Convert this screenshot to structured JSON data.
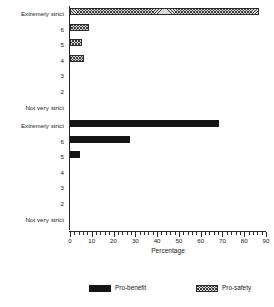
{
  "chart_data": {
    "type": "bar",
    "orientation": "horizontal",
    "title": "",
    "xlabel": "Percentage",
    "ylabel": "",
    "xlim": [
      0,
      90
    ],
    "xticks": [
      0,
      10,
      20,
      30,
      40,
      50,
      60,
      70,
      80,
      90
    ],
    "xtick_labels": [
      "0",
      "10",
      "20",
      "30",
      "40",
      "50",
      "60",
      "70",
      "80",
      "90"
    ],
    "minor_tick_step": 2,
    "grid": false,
    "legend_position": "bottom",
    "categories": [
      "Extremely strict",
      "6",
      "5",
      "4",
      "3",
      "2",
      "Not very strict"
    ],
    "panels": [
      {
        "name": "pro-safety",
        "series_name": "Pro-safety",
        "fill": "cross-hatch",
        "color": "#d9d9d9",
        "values": [
          86.7,
          8.7,
          5.5,
          6.4,
          0,
          0,
          0
        ]
      },
      {
        "name": "pro-benefit",
        "series_name": "Pro-benefit",
        "fill": "solid",
        "color": "#151515",
        "values": [
          68.3,
          27.5,
          4.6,
          0,
          0,
          0,
          0
        ]
      }
    ]
  },
  "axis": {
    "xlabel": "Percentage",
    "ticks": [
      {
        "value": 0,
        "label": "0"
      },
      {
        "value": 10,
        "label": "10"
      },
      {
        "value": 20,
        "label": "20"
      },
      {
        "value": 30,
        "label": "30"
      },
      {
        "value": 40,
        "label": "40"
      },
      {
        "value": 50,
        "label": "50"
      },
      {
        "value": 60,
        "label": "60"
      },
      {
        "value": 70,
        "label": "70"
      },
      {
        "value": 80,
        "label": "80"
      },
      {
        "value": 90,
        "label": "90"
      }
    ]
  },
  "legend": {
    "entries": [
      {
        "label": "Pro-benefit",
        "swatch": "solid-black-swatch"
      },
      {
        "label": "Pro-safety",
        "swatch": "hatched-gray-swatch"
      }
    ]
  },
  "panel_top": {
    "name": "pro-safety-panel",
    "categories": [
      {
        "label": "Extremely strict",
        "value": 86.7
      },
      {
        "label": "6",
        "value": 8.7
      },
      {
        "label": "5",
        "value": 5.5
      },
      {
        "label": "4",
        "value": 6.4
      },
      {
        "label": "3",
        "value": 0
      },
      {
        "label": "2",
        "value": 0
      },
      {
        "label": "Not very strict",
        "value": 0
      }
    ]
  },
  "panel_bottom": {
    "name": "pro-benefit-panel",
    "categories": [
      {
        "label": "Extremely strict",
        "value": 68.3
      },
      {
        "label": "6",
        "value": 27.5
      },
      {
        "label": "5",
        "value": 4.6
      },
      {
        "label": "4",
        "value": 0
      },
      {
        "label": "3",
        "value": 0
      },
      {
        "label": "2",
        "value": 0
      },
      {
        "label": "Not very strict",
        "value": 0
      }
    ]
  }
}
